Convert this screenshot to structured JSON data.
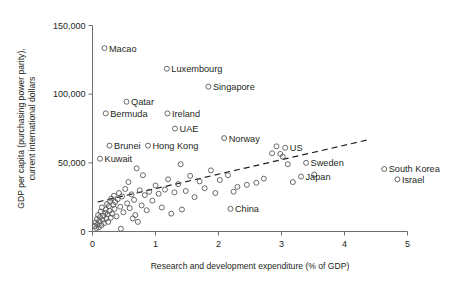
{
  "chart_data": {
    "type": "scatter",
    "title": "",
    "xlabel": "Research and development expenditure (% of GDP)",
    "ylabel_line1": "GDP per capita (purchasing power parity),",
    "ylabel_line2": "current international dollars",
    "xlim": [
      0,
      5
    ],
    "ylim": [
      0,
      150000
    ],
    "xticks": [
      0,
      1,
      2,
      3,
      4,
      5
    ],
    "xtick_labels": [
      "0",
      "1",
      "2",
      "3",
      "4",
      "5"
    ],
    "yticks": [
      0,
      50000,
      100000,
      150000
    ],
    "ytick_labels": [
      "0",
      "50,000",
      "100,000",
      "150,000"
    ],
    "grid": false,
    "legend": "none",
    "marker": "open-circle",
    "trendline": {
      "type": "linear-dashed",
      "x_start": 0.08,
      "y_start": 21500,
      "x_end": 4.35,
      "y_end": 66500
    },
    "labeled_points": [
      {
        "label": "Macao",
        "x": 0.19,
        "y": 133500,
        "label_side": "right"
      },
      {
        "label": "Luxembourg",
        "x": 1.18,
        "y": 118500,
        "label_side": "right"
      },
      {
        "label": "Singapore",
        "x": 1.84,
        "y": 105500,
        "label_side": "right"
      },
      {
        "label": "Qatar",
        "x": 0.54,
        "y": 94500,
        "label_side": "right"
      },
      {
        "label": "Bermuda",
        "x": 0.21,
        "y": 86000,
        "label_side": "right"
      },
      {
        "label": "Ireland",
        "x": 1.19,
        "y": 86000,
        "label_side": "right"
      },
      {
        "label": "UAE",
        "x": 1.31,
        "y": 75000,
        "label_side": "right"
      },
      {
        "label": "Norway",
        "x": 2.09,
        "y": 68000,
        "label_side": "right"
      },
      {
        "label": "Brunei",
        "x": 0.27,
        "y": 62500,
        "label_side": "right"
      },
      {
        "label": "Hong Kong",
        "x": 0.88,
        "y": 62500,
        "label_side": "right"
      },
      {
        "label": "US",
        "x": 3.06,
        "y": 61000,
        "label_side": "right"
      },
      {
        "label": "Kuwait",
        "x": 0.12,
        "y": 53000,
        "label_side": "right"
      },
      {
        "label": "Sweden",
        "x": 3.39,
        "y": 50000,
        "label_side": "right"
      },
      {
        "label": "Japan",
        "x": 3.31,
        "y": 40000,
        "label_side": "right"
      },
      {
        "label": "South Korea",
        "x": 4.63,
        "y": 45500,
        "label_side": "right"
      },
      {
        "label": "Israel",
        "x": 4.84,
        "y": 38000,
        "label_side": "right"
      },
      {
        "label": "China",
        "x": 2.19,
        "y": 16500,
        "label_side": "right"
      }
    ],
    "unlabeled_points": [
      {
        "x": 0.04,
        "y": 4000
      },
      {
        "x": 0.05,
        "y": 6500
      },
      {
        "x": 0.06,
        "y": 2500
      },
      {
        "x": 0.07,
        "y": 9000
      },
      {
        "x": 0.08,
        "y": 5000
      },
      {
        "x": 0.09,
        "y": 12000
      },
      {
        "x": 0.1,
        "y": 3000
      },
      {
        "x": 0.11,
        "y": 7500
      },
      {
        "x": 0.12,
        "y": 10500
      },
      {
        "x": 0.13,
        "y": 14500
      },
      {
        "x": 0.14,
        "y": 4500
      },
      {
        "x": 0.15,
        "y": 17500
      },
      {
        "x": 0.16,
        "y": 8500
      },
      {
        "x": 0.17,
        "y": 11500
      },
      {
        "x": 0.18,
        "y": 6000
      },
      {
        "x": 0.2,
        "y": 13500
      },
      {
        "x": 0.21,
        "y": 16000
      },
      {
        "x": 0.22,
        "y": 9500
      },
      {
        "x": 0.23,
        "y": 20000
      },
      {
        "x": 0.24,
        "y": 12500
      },
      {
        "x": 0.25,
        "y": 7000
      },
      {
        "x": 0.26,
        "y": 18500
      },
      {
        "x": 0.27,
        "y": 15000
      },
      {
        "x": 0.28,
        "y": 22000
      },
      {
        "x": 0.29,
        "y": 10000
      },
      {
        "x": 0.3,
        "y": 24000
      },
      {
        "x": 0.31,
        "y": 13000
      },
      {
        "x": 0.33,
        "y": 19500
      },
      {
        "x": 0.34,
        "y": 26000
      },
      {
        "x": 0.35,
        "y": 16500
      },
      {
        "x": 0.36,
        "y": 21500
      },
      {
        "x": 0.38,
        "y": 11000
      },
      {
        "x": 0.4,
        "y": 23500
      },
      {
        "x": 0.42,
        "y": 28000
      },
      {
        "x": 0.44,
        "y": 18000
      },
      {
        "x": 0.45,
        "y": 2000
      },
      {
        "x": 0.47,
        "y": 25500
      },
      {
        "x": 0.49,
        "y": 14000
      },
      {
        "x": 0.52,
        "y": 31000
      },
      {
        "x": 0.55,
        "y": 20500
      },
      {
        "x": 0.57,
        "y": 36000
      },
      {
        "x": 0.59,
        "y": 17000
      },
      {
        "x": 0.62,
        "y": 27000
      },
      {
        "x": 0.64,
        "y": 9500
      },
      {
        "x": 0.66,
        "y": 23000
      },
      {
        "x": 0.68,
        "y": 12000
      },
      {
        "x": 0.7,
        "y": 46000
      },
      {
        "x": 0.72,
        "y": 7000
      },
      {
        "x": 0.75,
        "y": 30000
      },
      {
        "x": 0.78,
        "y": 19000
      },
      {
        "x": 0.8,
        "y": 41000
      },
      {
        "x": 0.83,
        "y": 26500
      },
      {
        "x": 0.86,
        "y": 15500
      },
      {
        "x": 0.9,
        "y": 29000
      },
      {
        "x": 0.95,
        "y": 22500
      },
      {
        "x": 1.0,
        "y": 33500
      },
      {
        "x": 1.05,
        "y": 27500
      },
      {
        "x": 1.1,
        "y": 17500
      },
      {
        "x": 1.15,
        "y": 30500
      },
      {
        "x": 1.2,
        "y": 38000
      },
      {
        "x": 1.25,
        "y": 13000
      },
      {
        "x": 1.3,
        "y": 28500
      },
      {
        "x": 1.36,
        "y": 34500
      },
      {
        "x": 1.42,
        "y": 16000
      },
      {
        "x": 1.48,
        "y": 29500
      },
      {
        "x": 1.55,
        "y": 40500
      },
      {
        "x": 1.62,
        "y": 25000
      },
      {
        "x": 1.7,
        "y": 36500
      },
      {
        "x": 1.78,
        "y": 31500
      },
      {
        "x": 1.88,
        "y": 44500
      },
      {
        "x": 1.95,
        "y": 28000
      },
      {
        "x": 2.02,
        "y": 37500
      },
      {
        "x": 2.3,
        "y": 32500
      },
      {
        "x": 2.45,
        "y": 34000
      },
      {
        "x": 2.6,
        "y": 35500
      },
      {
        "x": 2.72,
        "y": 38500
      },
      {
        "x": 2.85,
        "y": 57000
      },
      {
        "x": 2.92,
        "y": 62000
      },
      {
        "x": 2.98,
        "y": 56500
      },
      {
        "x": 3.02,
        "y": 54500
      },
      {
        "x": 3.1,
        "y": 49000
      },
      {
        "x": 3.18,
        "y": 36000
      },
      {
        "x": 3.52,
        "y": 41500
      },
      {
        "x": 1.4,
        "y": 49000
      },
      {
        "x": 2.15,
        "y": 41000
      },
      {
        "x": 2.24,
        "y": 29000
      }
    ]
  }
}
